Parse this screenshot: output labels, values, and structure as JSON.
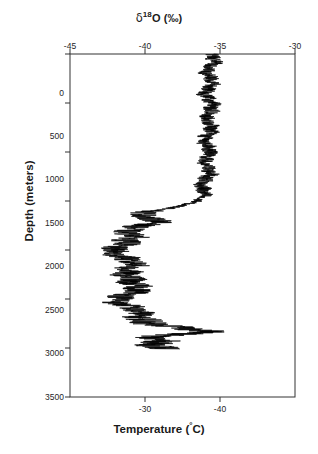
{
  "figure": {
    "background_color": "#ffffff",
    "line_color": "#000000",
    "axis_color": "#333333"
  },
  "axes": {
    "top": {
      "title_delta": "δ",
      "title_superscript": "18",
      "title_rest": "O (‰)",
      "title_plain": "δ18O (‰)",
      "ticks": [
        "-45",
        "-40",
        "-35",
        "-30"
      ]
    },
    "bottom": {
      "title_prefix": "Temperature (",
      "title_superscript": "°",
      "title_suffix": "C)",
      "title_plain": "Temperature (°C)",
      "ticks": [
        "-30",
        "-40"
      ]
    },
    "left": {
      "title": "Depth (meters)",
      "ticks": [
        "0",
        "500",
        "1000",
        "1500",
        "2000",
        "2500",
        "3000",
        "3500"
      ]
    }
  },
  "chart_data": {
    "type": "line",
    "title": "",
    "xlabel": "δ18O (‰)",
    "ylabel": "Depth (meters)",
    "x2label": "Temperature (°C)",
    "orientation": "vertical-profile",
    "grid": false,
    "legend": "none",
    "xlim": [
      -45,
      -30
    ],
    "ylim": [
      3500,
      0
    ],
    "y_inverted": true,
    "xticks": [
      -45,
      -40,
      -35,
      -30
    ],
    "yticks": [
      0,
      500,
      1000,
      1500,
      2000,
      2500,
      3000,
      3500
    ],
    "secondary_x": {
      "label": "Temperature (°C)",
      "ticks": [
        -30,
        -40
      ],
      "tick_positions_in_d18o": [
        -40.0,
        -35.0
      ]
    },
    "series": [
      {
        "name": "δ18O profile",
        "xlabel": "δ18O (‰)",
        "ylabel": "Depth (m)",
        "comment": "Ice core oxygen isotope record; x = d18O permil, y = depth meters. High-frequency noise superposed on a smooth baseline.",
        "baseline": [
          {
            "depth": 0,
            "d18O": -35.6
          },
          {
            "depth": 100,
            "d18O": -35.5
          },
          {
            "depth": 200,
            "d18O": -35.7
          },
          {
            "depth": 300,
            "d18O": -35.6
          },
          {
            "depth": 400,
            "d18O": -35.8
          },
          {
            "depth": 500,
            "d18O": -35.7
          },
          {
            "depth": 600,
            "d18O": -35.6
          },
          {
            "depth": 700,
            "d18O": -35.8
          },
          {
            "depth": 800,
            "d18O": -35.7
          },
          {
            "depth": 900,
            "d18O": -35.9
          },
          {
            "depth": 1000,
            "d18O": -35.8
          },
          {
            "depth": 1100,
            "d18O": -35.9
          },
          {
            "depth": 1200,
            "d18O": -35.8
          },
          {
            "depth": 1300,
            "d18O": -36.0
          },
          {
            "depth": 1400,
            "d18O": -36.1
          },
          {
            "depth": 1450,
            "d18O": -36.3
          },
          {
            "depth": 1500,
            "d18O": -36.6
          },
          {
            "depth": 1550,
            "d18O": -37.4
          },
          {
            "depth": 1600,
            "d18O": -39.2
          },
          {
            "depth": 1650,
            "d18O": -40.6
          },
          {
            "depth": 1700,
            "d18O": -39.3
          },
          {
            "depth": 1750,
            "d18O": -40.0
          },
          {
            "depth": 1800,
            "d18O": -41.0
          },
          {
            "depth": 1850,
            "d18O": -40.6
          },
          {
            "depth": 1900,
            "d18O": -41.4
          },
          {
            "depth": 1950,
            "d18O": -41.8
          },
          {
            "depth": 2000,
            "d18O": -42.0
          },
          {
            "depth": 2050,
            "d18O": -41.5
          },
          {
            "depth": 2100,
            "d18O": -41.2
          },
          {
            "depth": 2150,
            "d18O": -41.0
          },
          {
            "depth": 2200,
            "d18O": -41.3
          },
          {
            "depth": 2250,
            "d18O": -40.9
          },
          {
            "depth": 2300,
            "d18O": -40.7
          },
          {
            "depth": 2350,
            "d18O": -41.1
          },
          {
            "depth": 2400,
            "d18O": -40.6
          },
          {
            "depth": 2450,
            "d18O": -40.9
          },
          {
            "depth": 2500,
            "d18O": -41.4
          },
          {
            "depth": 2550,
            "d18O": -41.6
          },
          {
            "depth": 2600,
            "d18O": -41.0
          },
          {
            "depth": 2650,
            "d18O": -40.6
          },
          {
            "depth": 2700,
            "d18O": -40.1
          },
          {
            "depth": 2750,
            "d18O": -39.0
          },
          {
            "depth": 2800,
            "d18O": -37.6
          },
          {
            "depth": 2830,
            "d18O": -35.6
          },
          {
            "depth": 2860,
            "d18O": -38.6
          },
          {
            "depth": 2890,
            "d18O": -39.6
          },
          {
            "depth": 2930,
            "d18O": -38.9
          },
          {
            "depth": 2960,
            "d18O": -38.7
          },
          {
            "depth": 3000,
            "d18O": -38.9
          },
          {
            "depth": 3010,
            "d18O": -38.8
          }
        ],
        "noise_amplitude": [
          {
            "depth_range": [
              0,
              1450
            ],
            "amplitude": 0.52
          },
          {
            "depth_range": [
              1450,
              1600
            ],
            "amplitude": 0.35
          },
          {
            "depth_range": [
              1600,
              2700
            ],
            "amplitude": 0.95
          },
          {
            "depth_range": [
              2700,
              3010
            ],
            "amplitude": 1.25
          }
        ],
        "data_end_depth": 3010,
        "data_start_depth": 0
      }
    ]
  }
}
